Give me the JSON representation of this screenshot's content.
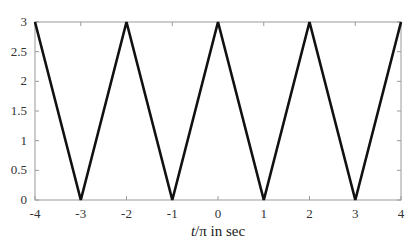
{
  "chart_data": {
    "type": "line",
    "title": "",
    "xlabel_italic": "t",
    "xlabel_rest": "/π in sec",
    "ylabel": "",
    "xlim": [
      -4,
      4
    ],
    "ylim": [
      0,
      3
    ],
    "grid": false,
    "legend": null,
    "x_ticks": [
      "-4",
      "-3",
      "-2",
      "-1",
      "0",
      "1",
      "2",
      "3",
      "4"
    ],
    "y_ticks": [
      "0",
      "0.5",
      "1",
      "1.5",
      "2",
      "2.5",
      "3"
    ],
    "series": [
      {
        "name": "triangular wave",
        "color": "#111111",
        "x": [
          -4,
          -3,
          -2,
          -1,
          0,
          1,
          2,
          3,
          4
        ],
        "y": [
          3,
          0,
          3,
          0,
          3,
          0,
          3,
          0,
          3
        ]
      }
    ]
  },
  "colors": {
    "axis": "#9a9a9a",
    "line": "#111111"
  }
}
